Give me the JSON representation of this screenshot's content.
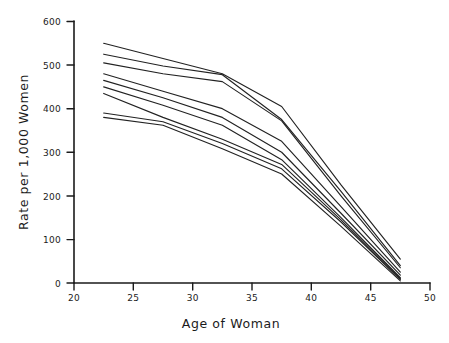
{
  "chart_data": {
    "type": "line",
    "title": "",
    "subtitle": "",
    "xlabel": "Age of Woman",
    "ylabel": "Rate per 1,000 Women",
    "xlim": [
      20,
      50
    ],
    "ylim": [
      0,
      600
    ],
    "xticks": [
      20,
      25,
      30,
      35,
      40,
      45,
      50
    ],
    "yticks": [
      0,
      100,
      200,
      300,
      400,
      500,
      600
    ],
    "xtick_labels": [
      "20",
      "25",
      "30",
      "35",
      "40",
      "45",
      "50"
    ],
    "ytick_labels": [
      "0",
      "100",
      "200",
      "300",
      "400",
      "500",
      "600"
    ],
    "grid": false,
    "legend": false,
    "legend_position": "none",
    "annotations": [],
    "x": [
      22.5,
      27.5,
      32.5,
      37.5,
      42.5,
      47.5
    ],
    "series": [
      {
        "name": "series-1",
        "values": [
          550,
          515,
          480,
          405,
          225,
          55
        ]
      },
      {
        "name": "series-2",
        "values": [
          525,
          498,
          478,
          375,
          210,
          40
        ]
      },
      {
        "name": "series-3",
        "values": [
          505,
          480,
          462,
          372,
          200,
          35
        ]
      },
      {
        "name": "series-4",
        "values": [
          480,
          440,
          400,
          325,
          175,
          25
        ]
      },
      {
        "name": "series-5",
        "values": [
          465,
          425,
          380,
          300,
          160,
          18
        ]
      },
      {
        "name": "series-6",
        "values": [
          450,
          408,
          362,
          283,
          150,
          12
        ]
      },
      {
        "name": "series-7",
        "values": [
          435,
          380,
          330,
          272,
          145,
          10
        ]
      },
      {
        "name": "series-8",
        "values": [
          390,
          370,
          320,
          262,
          140,
          8
        ]
      },
      {
        "name": "series-9",
        "values": [
          380,
          362,
          308,
          250,
          130,
          5
        ]
      }
    ]
  },
  "axes": {
    "x_title": "Age of Woman",
    "y_title": "Rate per 1,000 Women"
  },
  "ticks": {
    "x": [
      "20",
      "25",
      "30",
      "35",
      "40",
      "45",
      "50"
    ],
    "y": [
      "0",
      "100",
      "200",
      "300",
      "400",
      "500",
      "600"
    ]
  },
  "colors": {
    "line": "#222222",
    "axis": "#1b1b1b",
    "background": "#ffffff"
  }
}
